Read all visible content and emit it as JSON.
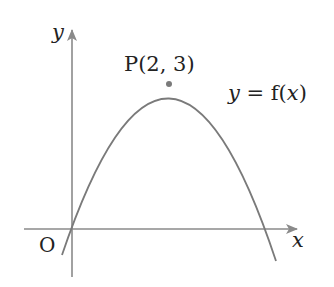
{
  "diagram": {
    "type": "function-graph",
    "colors": {
      "axis": "#8a8a8a",
      "curve": "#7a7a7a",
      "point": "#7a7a7a",
      "text": "#222222",
      "background": "#ffffff"
    },
    "axes": {
      "x_label": "x",
      "y_label": "y",
      "origin_label": "O"
    },
    "curve": {
      "label": "y = f(x)",
      "label_y": "y",
      "label_eq": " = f(",
      "label_x": "x",
      "label_close": ")",
      "shape": "downward parabola through origin"
    },
    "point": {
      "name": "P",
      "label": "P(2, 3)",
      "x": 2,
      "y": 3
    }
  }
}
